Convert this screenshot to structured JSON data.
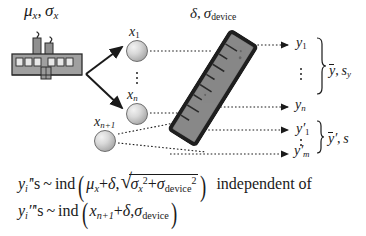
{
  "figure": {
    "background_color": "#ffffff",
    "ink_color": "#1a1a1a"
  },
  "labels": {
    "process_params": {
      "mu": "μ",
      "mu_sub": "x",
      "sigma": "σ",
      "sigma_sub": "x",
      "text": "μₓ, σₓ"
    },
    "device_params": {
      "delta": "δ",
      "sigma": "σ",
      "sigma_sub": "device",
      "text": "δ, σdevice"
    }
  },
  "nodes": {
    "x1": {
      "base": "x",
      "sub": "1"
    },
    "xn": {
      "base": "x",
      "sub": "n"
    },
    "xn1": {
      "base": "x",
      "sub": "n+1"
    }
  },
  "outputs": {
    "y1": {
      "base": "y",
      "sub": "1"
    },
    "yn": {
      "base": "y",
      "sub": "n"
    },
    "yp1": {
      "base": "y",
      "prime": "′",
      "sub": "1"
    },
    "ypm": {
      "base": "y",
      "prime": "′",
      "sub": "m"
    }
  },
  "summaries": {
    "first": {
      "ybar": "y",
      "sep": ", ",
      "s": "s",
      "s_sub": "y",
      "text": "ȳ, s_y"
    },
    "second": {
      "ybar": "y",
      "prime": "′",
      "sep": ", ",
      "s": "s",
      "text": "ȳ′, s"
    }
  },
  "ellipses": {
    "x_column": "⋮",
    "y_column": "⋮",
    "yprime_column": "⋮"
  },
  "formulas": {
    "line1": {
      "lhs_base": "y",
      "lhs_sub": "i",
      "lhs_prime": "′",
      "lhs_suffix": "'s",
      "relation": "~",
      "operator": "ind",
      "open_paren": "(",
      "arg1_a": "μ",
      "arg1_a_sub": "x",
      "arg1_plus": "+",
      "arg1_b": "δ",
      "comma": ",",
      "radical_glyph": "√",
      "rad_term1": "σ",
      "rad_term1_sub": "x",
      "rad_term1_sup": "2",
      "rad_plus": "+",
      "rad_term2": "σ",
      "rad_term2_sub": "device",
      "rad_term2_sup": "2",
      "close_paren": ")",
      "trailing": "independent of",
      "plain": "y_i's ~ ind(μ_x + δ, √(σ_x² + σ_device²)) independent of"
    },
    "line2": {
      "lhs_base": "y",
      "lhs_sub": "i",
      "lhs_prime": "′′",
      "lhs_suffix": "'s",
      "relation": "~",
      "operator": "ind",
      "open_paren": "(",
      "arg1": "x",
      "arg1_sub": "n+1",
      "arg1_plus": "+",
      "arg1_b": "δ",
      "comma": ",",
      "arg2": "σ",
      "arg2_sub": "device",
      "close_paren": ")",
      "plain": "y_i''s ~ ind(x_{n+1} + δ, σ_device)"
    }
  },
  "icons": {
    "factory": "factory-icon",
    "ruler": "ruler-device-icon",
    "node": "circle-node-icon",
    "arrow_solid": "solid-arrow-icon",
    "arrow_dotted": "dotted-arrow-icon",
    "brace": "curly-brace-icon"
  },
  "colors": {
    "factory_fill": "#9a9a9a",
    "device_fill": "#7a7a7a",
    "device_edge": "#2b2b2b",
    "node_fill": "#c8c8c8",
    "line": "#1a1a1a"
  }
}
